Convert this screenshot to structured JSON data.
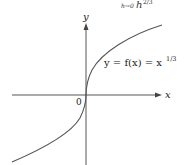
{
  "header_fragment": {
    "subscript": "h→0",
    "expression": "h",
    "exponent": "2/3"
  },
  "axes": {
    "x_label": "x",
    "y_label": "y",
    "origin_label": "0"
  },
  "curve": {
    "label_prefix": "y = f(x) = x",
    "label_exponent": "1/3",
    "function": "x^(1/3)",
    "color": "#555555"
  },
  "colors": {
    "axis": "#444444",
    "text": "#222222"
  }
}
